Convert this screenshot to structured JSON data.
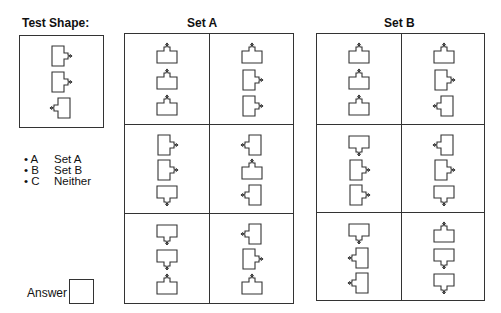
{
  "test": {
    "title": "Test Shape:",
    "shapes": [
      "right",
      "right",
      "left"
    ]
  },
  "set_a": {
    "title": "Set A",
    "cells": [
      [
        "up",
        "up",
        "up"
      ],
      [
        "up",
        "right",
        "right"
      ],
      [
        "right",
        "right",
        "down"
      ],
      [
        "left",
        "up",
        "left"
      ],
      [
        "down",
        "down",
        "up"
      ],
      [
        "left",
        "right",
        "up"
      ]
    ]
  },
  "set_b": {
    "title": "Set B",
    "cells": [
      [
        "up",
        "up",
        "up"
      ],
      [
        "up",
        "right",
        "left"
      ],
      [
        "down",
        "right",
        "right"
      ],
      [
        "left",
        "right",
        "down"
      ],
      [
        "down",
        "left",
        "left"
      ],
      [
        "up",
        "down",
        "down"
      ]
    ]
  },
  "options": [
    {
      "key": "• A",
      "label": "Set A"
    },
    {
      "key": "• B",
      "label": "Set B"
    },
    {
      "key": "• C",
      "label": "Neither"
    }
  ],
  "answer": {
    "label": "Answer",
    "value": ""
  },
  "colors": {
    "line": "#333333",
    "background": "#ffffff"
  }
}
